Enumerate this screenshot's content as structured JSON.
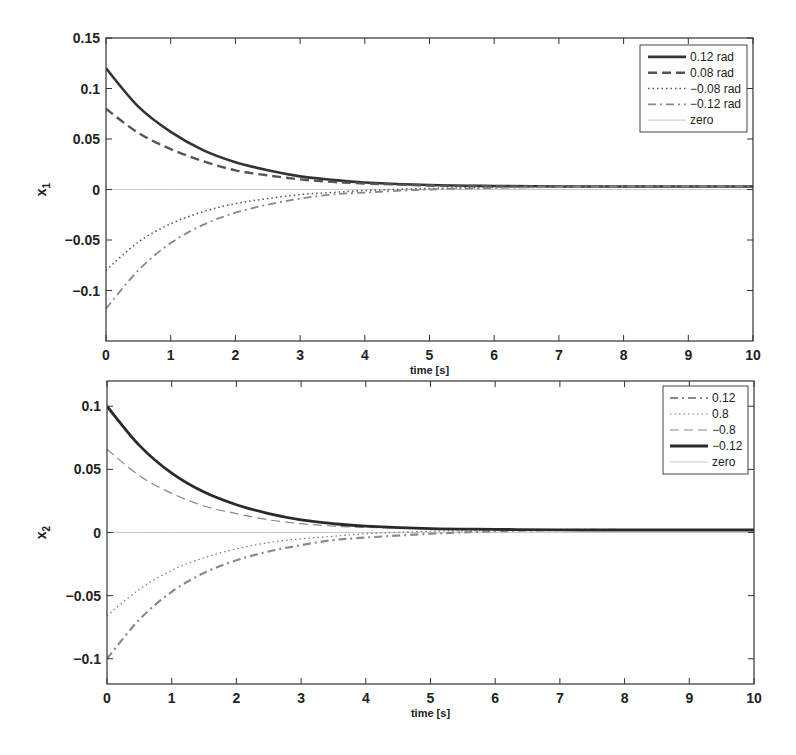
{
  "chart_data": [
    {
      "type": "line",
      "title": "",
      "xlabel": "time [s]",
      "ylabel": "x_1",
      "ylabel_main": "x",
      "ylabel_sub": "1",
      "xlim": [
        0,
        10
      ],
      "ylim": [
        -0.15,
        0.15
      ],
      "xticks": [
        0,
        1,
        2,
        3,
        4,
        5,
        6,
        7,
        8,
        9,
        10
      ],
      "xtick_labels": [
        "0",
        "1",
        "2",
        "3",
        "4",
        "5",
        "6",
        "7",
        "8",
        "9",
        "10"
      ],
      "yticks": [
        0.15,
        0.1,
        0.05,
        0,
        -0.05,
        -0.1
      ],
      "ytick_labels": [
        "0.15",
        "0.1",
        "0.05",
        "0",
        "−0.05",
        "−0.1"
      ],
      "grid": false,
      "legend_position": "upper right",
      "x": [
        0,
        0.5,
        1,
        1.5,
        2,
        2.5,
        3,
        3.5,
        4,
        5,
        6,
        7,
        8,
        9,
        10
      ],
      "series": [
        {
          "name": "0.12 rad",
          "style": "solid",
          "width": 2.6,
          "color": "#333333",
          "values": [
            0.12,
            0.082,
            0.057,
            0.039,
            0.027,
            0.019,
            0.013,
            0.0095,
            0.007,
            0.0045,
            0.0035,
            0.003,
            0.003,
            0.003,
            0.003
          ]
        },
        {
          "name": "0.08 rad",
          "style": "dashed",
          "width": 2.4,
          "color": "#555555",
          "values": [
            0.08,
            0.056,
            0.04,
            0.028,
            0.019,
            0.014,
            0.01,
            0.0075,
            0.006,
            0.004,
            0.0033,
            0.003,
            0.003,
            0.003,
            0.003
          ]
        },
        {
          "name": "−0.08 rad",
          "style": "dotted",
          "width": 1.5,
          "color": "#555555",
          "values": [
            -0.08,
            -0.052,
            -0.034,
            -0.022,
            -0.014,
            -0.009,
            -0.005,
            -0.003,
            -0.001,
            0.001,
            0.002,
            0.0025,
            0.003,
            0.003,
            0.003
          ]
        },
        {
          "name": "−0.12 rad",
          "style": "dashdot",
          "width": 1.8,
          "color": "#888888",
          "values": [
            -0.118,
            -0.08,
            -0.053,
            -0.035,
            -0.023,
            -0.015,
            -0.009,
            -0.005,
            -0.003,
            0.0,
            0.0015,
            0.0025,
            0.003,
            0.003,
            0.003
          ]
        },
        {
          "name": "zero",
          "style": "solid",
          "width": 1,
          "color": "#c8c8c8",
          "values": [
            0,
            0,
            0,
            0,
            0,
            0,
            0,
            0,
            0,
            0,
            0,
            0,
            0,
            0,
            0
          ]
        }
      ]
    },
    {
      "type": "line",
      "title": "",
      "xlabel": "time [s]",
      "ylabel": "x_2",
      "ylabel_main": "x",
      "ylabel_sub": "2",
      "xlim": [
        0,
        10
      ],
      "ylim": [
        -0.12,
        0.12
      ],
      "xticks": [
        0,
        1,
        2,
        3,
        4,
        5,
        6,
        7,
        8,
        9,
        10
      ],
      "xtick_labels": [
        "0",
        "1",
        "2",
        "3",
        "4",
        "5",
        "6",
        "7",
        "8",
        "9",
        "10"
      ],
      "yticks": [
        0.1,
        0.05,
        0,
        -0.05,
        -0.1
      ],
      "ytick_labels": [
        "0.1",
        "0.05",
        "0",
        "−0.05",
        "−0.1"
      ],
      "grid": false,
      "legend_position": "upper right",
      "x": [
        0,
        0.5,
        1,
        1.5,
        2,
        2.5,
        3,
        3.5,
        4,
        5,
        6,
        7,
        8,
        9,
        10
      ],
      "series": [
        {
          "name": "0.12",
          "style": "dashdot",
          "width": 2.2,
          "color": "#8a8a8a",
          "values": [
            -0.1,
            -0.069,
            -0.047,
            -0.032,
            -0.022,
            -0.015,
            -0.01,
            -0.006,
            -0.004,
            -0.001,
            0.001,
            0.002,
            0.002,
            0.002,
            0.002
          ]
        },
        {
          "name": "0.8",
          "style": "dotted",
          "width": 1.2,
          "color": "#777777",
          "values": [
            -0.066,
            -0.045,
            -0.03,
            -0.02,
            -0.013,
            -0.008,
            -0.005,
            -0.003,
            -0.001,
            0.001,
            0.0015,
            0.002,
            0.002,
            0.002,
            0.002
          ]
        },
        {
          "name": "−0.8",
          "style": "dashed",
          "width": 1.2,
          "color": "#888888",
          "values": [
            0.066,
            0.045,
            0.031,
            0.021,
            0.015,
            0.01,
            0.007,
            0.005,
            0.004,
            0.003,
            0.002,
            0.002,
            0.002,
            0.002,
            0.002
          ]
        },
        {
          "name": "−0.12",
          "style": "solid",
          "width": 2.8,
          "color": "#2a2a2a",
          "values": [
            0.1,
            0.069,
            0.047,
            0.032,
            0.022,
            0.015,
            0.01,
            0.007,
            0.005,
            0.003,
            0.0025,
            0.002,
            0.002,
            0.002,
            0.002
          ]
        },
        {
          "name": "zero",
          "style": "solid",
          "width": 1,
          "color": "#c8c8c8",
          "values": [
            0,
            0,
            0,
            0,
            0,
            0,
            0,
            0,
            0,
            0,
            0,
            0,
            0,
            0,
            0
          ]
        }
      ]
    }
  ],
  "layout": {
    "panels": [
      {
        "left": 106,
        "top": 38,
        "right": 753,
        "bottom": 341,
        "legend": {
          "left": 640,
          "top": 45,
          "right": 747,
          "bottom": 132,
          "sample_x1": 648,
          "sample_x2": 686,
          "text_x": 690
        }
      },
      {
        "left": 107,
        "top": 381,
        "right": 754,
        "bottom": 684,
        "legend": {
          "left": 663,
          "top": 386,
          "right": 748,
          "bottom": 474,
          "sample_x1": 670,
          "sample_x2": 708,
          "text_x": 712
        }
      }
    ]
  }
}
